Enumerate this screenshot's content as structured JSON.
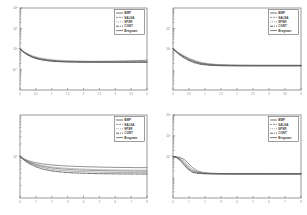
{
  "figure": {
    "type": "multi-panel-figure",
    "panels": 4,
    "layout": "2x2",
    "background": "#ffffff",
    "axis_color": "#6e6e6e",
    "text_color": "#7a7a7a"
  },
  "series_names": [
    "BMP",
    "SALSA",
    "SPSR",
    "CGNT",
    "Bregman"
  ],
  "series_colors": [
    "#4a4a4a",
    "#707070",
    "#8a8a8a",
    "#3c3c3c",
    "#5a5a5a"
  ],
  "series_dashes": [
    "none",
    "2 1",
    "1 1",
    "3 1 1 1",
    "none"
  ],
  "chart_data": [
    {
      "type": "line",
      "panel": "top-left",
      "title": "",
      "xlabel": "",
      "ylabel": "",
      "yscale": "log",
      "xlim": [
        0,
        4
      ],
      "ylim": [
        0.01,
        100
      ],
      "grid": false,
      "legend_position": "top-right",
      "xticks": [
        "0",
        "0.5",
        "1",
        "1.5",
        "2",
        "2.5",
        "3",
        "3.5",
        "4"
      ],
      "yticks": [
        "10^2",
        "10^1",
        "10^0",
        "10^-1"
      ],
      "x": [
        0,
        0.12,
        0.25,
        0.4,
        0.6,
        0.85,
        1.1,
        1.4,
        1.8,
        2.2,
        2.6,
        3.0,
        3.4,
        3.7,
        4.0
      ],
      "series": [
        {
          "name": "BMP",
          "values": [
            1.0,
            0.72,
            0.55,
            0.43,
            0.35,
            0.3,
            0.27,
            0.255,
            0.248,
            0.246,
            0.248,
            0.253,
            0.262,
            0.272,
            0.285
          ]
        },
        {
          "name": "SALSA",
          "values": [
            1.0,
            0.7,
            0.52,
            0.4,
            0.32,
            0.275,
            0.252,
            0.24,
            0.234,
            0.232,
            0.231,
            0.231,
            0.231,
            0.231,
            0.231
          ]
        },
        {
          "name": "SPSR",
          "values": [
            1.0,
            0.74,
            0.58,
            0.46,
            0.38,
            0.325,
            0.292,
            0.272,
            0.259,
            0.254,
            0.252,
            0.251,
            0.251,
            0.251,
            0.251
          ]
        },
        {
          "name": "CGNT",
          "values": [
            1.0,
            0.68,
            0.5,
            0.385,
            0.31,
            0.268,
            0.246,
            0.234,
            0.228,
            0.226,
            0.225,
            0.225,
            0.225,
            0.225,
            0.225
          ]
        },
        {
          "name": "Bregman",
          "values": [
            1.0,
            0.71,
            0.53,
            0.41,
            0.33,
            0.285,
            0.259,
            0.245,
            0.237,
            0.234,
            0.233,
            0.233,
            0.233,
            0.233,
            0.233
          ]
        }
      ]
    },
    {
      "type": "line",
      "panel": "top-right",
      "title": "",
      "xlabel": "",
      "ylabel": "",
      "yscale": "log",
      "xlim": [
        0,
        4
      ],
      "ylim": [
        0.01,
        100
      ],
      "grid": false,
      "legend_position": "top-right",
      "xticks": [
        "0",
        "0.5",
        "1",
        "1.5",
        "2",
        "2.5",
        "3",
        "3.5",
        "4"
      ],
      "yticks": [
        "10^1",
        "10^0"
      ],
      "x": [
        0,
        0.1,
        0.2,
        0.35,
        0.5,
        0.7,
        0.9,
        1.15,
        1.45,
        1.8,
        2.2,
        2.6,
        3.0,
        3.5,
        4.0
      ],
      "series": [
        {
          "name": "BMP",
          "values": [
            1.0,
            0.78,
            0.6,
            0.44,
            0.33,
            0.25,
            0.205,
            0.18,
            0.168,
            0.162,
            0.16,
            0.159,
            0.159,
            0.159,
            0.159
          ]
        },
        {
          "name": "SALSA",
          "values": [
            1.0,
            0.74,
            0.55,
            0.39,
            0.29,
            0.222,
            0.186,
            0.168,
            0.159,
            0.155,
            0.154,
            0.153,
            0.153,
            0.153,
            0.153
          ]
        },
        {
          "name": "SPSR",
          "values": [
            1.0,
            0.8,
            0.63,
            0.47,
            0.355,
            0.268,
            0.218,
            0.19,
            0.175,
            0.167,
            0.164,
            0.163,
            0.162,
            0.162,
            0.162
          ]
        },
        {
          "name": "CGNT",
          "values": [
            1.0,
            0.72,
            0.52,
            0.365,
            0.268,
            0.205,
            0.175,
            0.16,
            0.153,
            0.15,
            0.149,
            0.149,
            0.149,
            0.149,
            0.149
          ]
        },
        {
          "name": "Bregman",
          "values": [
            1.0,
            0.76,
            0.57,
            0.41,
            0.305,
            0.234,
            0.194,
            0.173,
            0.163,
            0.158,
            0.156,
            0.156,
            0.156,
            0.156,
            0.156
          ]
        }
      ]
    },
    {
      "type": "line",
      "panel": "bottom-left",
      "title": "",
      "xlabel": "",
      "ylabel": "",
      "yscale": "log",
      "xlim": [
        0,
        8
      ],
      "ylim": [
        0.1,
        10
      ],
      "grid": false,
      "legend_position": "top-right",
      "xticks": [
        "0",
        "1",
        "2",
        "3",
        "4",
        "5",
        "6",
        "7",
        "8"
      ],
      "yticks": [
        "10^0"
      ],
      "x": [
        0,
        0.25,
        0.5,
        0.9,
        1.4,
        2.0,
        2.7,
        3.4,
        4.2,
        5.0,
        5.8,
        6.5,
        7.2,
        7.6,
        8.0
      ],
      "series": [
        {
          "name": "BMP",
          "values": [
            1.0,
            0.88,
            0.8,
            0.72,
            0.665,
            0.625,
            0.598,
            0.58,
            0.566,
            0.556,
            0.549,
            0.544,
            0.54,
            0.538,
            0.537
          ]
        },
        {
          "name": "SALSA",
          "values": [
            1.0,
            0.84,
            0.73,
            0.625,
            0.545,
            0.49,
            0.458,
            0.44,
            0.428,
            0.42,
            0.415,
            0.412,
            0.41,
            0.409,
            0.408
          ]
        },
        {
          "name": "SPSR",
          "values": [
            1.0,
            0.86,
            0.765,
            0.675,
            0.605,
            0.558,
            0.528,
            0.508,
            0.493,
            0.483,
            0.476,
            0.471,
            0.468,
            0.466,
            0.465
          ]
        },
        {
          "name": "CGNT",
          "values": [
            1.0,
            0.82,
            0.7,
            0.585,
            0.5,
            0.448,
            0.418,
            0.402,
            0.392,
            0.386,
            0.382,
            0.38,
            0.378,
            0.378,
            0.377
          ]
        },
        {
          "name": "Bregman",
          "values": [
            1.0,
            0.85,
            0.75,
            0.655,
            0.58,
            0.53,
            0.5,
            0.48,
            0.467,
            0.458,
            0.452,
            0.448,
            0.445,
            0.444,
            0.443
          ]
        }
      ]
    },
    {
      "type": "line",
      "panel": "bottom-right",
      "title": "",
      "xlabel": "",
      "ylabel": "",
      "yscale": "log",
      "xlim": [
        0,
        8
      ],
      "ylim": [
        0.01,
        100
      ],
      "grid": false,
      "legend_position": "top-right",
      "xticks": [
        "0",
        "1",
        "2",
        "3",
        "4",
        "5",
        "6",
        "7",
        "8"
      ],
      "yticks": [
        "10^2",
        "10^1",
        "10^0"
      ],
      "x": [
        0,
        0.2,
        0.45,
        0.7,
        0.95,
        1.2,
        1.5,
        1.9,
        2.4,
        3.0,
        3.8,
        4.6,
        5.5,
        6.5,
        8.0
      ],
      "series": [
        {
          "name": "BMP",
          "values": [
            1.0,
            0.97,
            0.9,
            0.72,
            0.48,
            0.3,
            0.205,
            0.168,
            0.156,
            0.152,
            0.15,
            0.15,
            0.149,
            0.149,
            0.149
          ]
        },
        {
          "name": "SALSA",
          "values": [
            1.0,
            0.92,
            0.7,
            0.44,
            0.265,
            0.19,
            0.163,
            0.152,
            0.147,
            0.145,
            0.144,
            0.144,
            0.144,
            0.144,
            0.144
          ]
        },
        {
          "name": "SPSR",
          "values": [
            1.0,
            0.95,
            0.82,
            0.58,
            0.365,
            0.24,
            0.184,
            0.161,
            0.152,
            0.149,
            0.147,
            0.147,
            0.147,
            0.147,
            0.147
          ]
        },
        {
          "name": "CGNT",
          "values": [
            1.0,
            0.9,
            0.65,
            0.39,
            0.235,
            0.175,
            0.156,
            0.148,
            0.145,
            0.143,
            0.143,
            0.143,
            0.143,
            0.143,
            0.143
          ]
        },
        {
          "name": "Bregman",
          "values": [
            1.0,
            0.93,
            0.75,
            0.5,
            0.305,
            0.21,
            0.172,
            0.156,
            0.149,
            0.147,
            0.146,
            0.146,
            0.146,
            0.146,
            0.146
          ]
        }
      ]
    }
  ]
}
